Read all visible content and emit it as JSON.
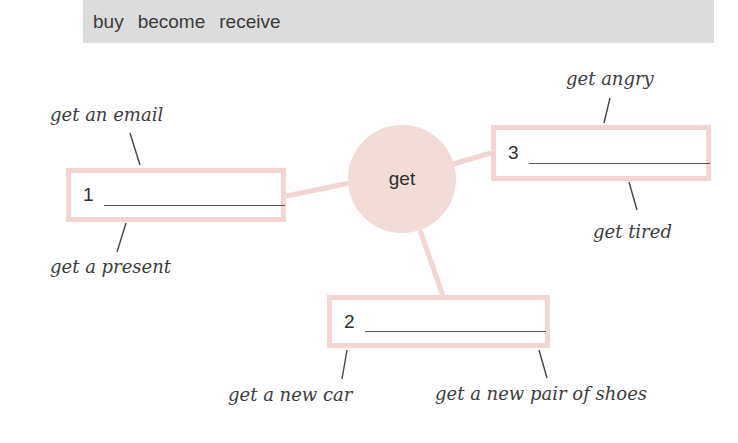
{
  "word_bank": {
    "words": [
      "buy",
      "become",
      "receive"
    ],
    "background": "#dcdcdc"
  },
  "diagram": {
    "hub": {
      "label": "get",
      "color": "#f2dcd8"
    },
    "box_border_color": "#f3d6d3",
    "boxes": [
      {
        "number": "1",
        "answer": "",
        "collocations": [
          "get an email",
          "get a present"
        ]
      },
      {
        "number": "2",
        "answer": "",
        "collocations": [
          "get a new car",
          "get a new pair of shoes"
        ]
      },
      {
        "number": "3",
        "answer": "",
        "collocations": [
          "get angry",
          "get tired"
        ]
      }
    ]
  }
}
